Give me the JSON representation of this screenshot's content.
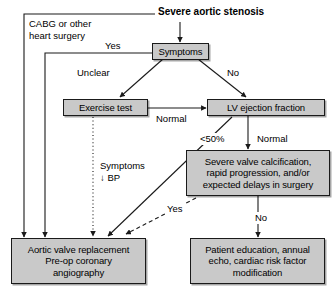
{
  "figure": {
    "type": "flowchart",
    "colors": {
      "node_fill": "#c9c9c9",
      "node_border": "#1a1a1a",
      "edge": "#1a1a1a",
      "background": "#ffffff"
    }
  },
  "title": {
    "text": "Severe aortic stenosis"
  },
  "annotations": {
    "cabg": "CABG or other\nheart surgery"
  },
  "nodes": [
    {
      "id": "symptoms",
      "label": "Symptoms"
    },
    {
      "id": "exercise_test",
      "label": "Exercise test"
    },
    {
      "id": "lv_ef",
      "label": "LV ejection fraction"
    },
    {
      "id": "severe_calc",
      "label": "Severe valve calcification,\nrapid progression, and/or\nexpected delays in surgery"
    },
    {
      "id": "avr",
      "label": "Aortic valve replacement\nPre-op coronary\nangiography"
    },
    {
      "id": "education",
      "label": "Patient education, annual\necho, cardiac risk factor\nmodification"
    }
  ],
  "edge_labels": [
    {
      "id": "yes_cabg",
      "text": "Yes"
    },
    {
      "id": "unclear",
      "text": "Unclear"
    },
    {
      "id": "no_symptoms",
      "text": "No"
    },
    {
      "id": "normal_ex",
      "text": "Normal"
    },
    {
      "id": "lt50",
      "text": "<50%"
    },
    {
      "id": "normal_ef",
      "text": "Normal"
    },
    {
      "id": "symptoms_bp",
      "text": "Symptoms\n↓ BP"
    },
    {
      "id": "yes_calc",
      "text": "Yes"
    },
    {
      "id": "no_calc",
      "text": "No"
    }
  ]
}
